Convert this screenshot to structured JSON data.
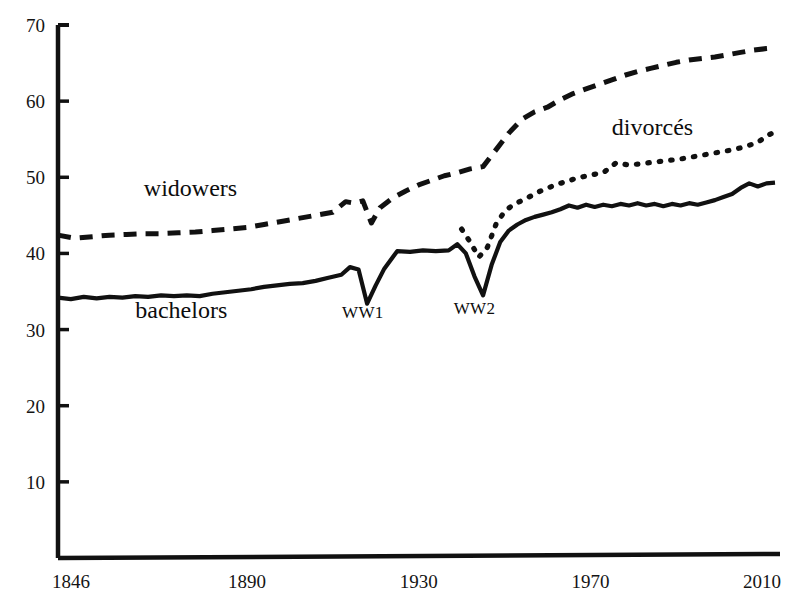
{
  "chart_data": {
    "type": "line",
    "title": "",
    "subtitle": "",
    "xlabel": "",
    "ylabel": "",
    "xlim": [
      1846,
      2013
    ],
    "ylim": [
      0,
      70
    ],
    "grid": false,
    "legend_position": "inline-annotations",
    "y_ticks": [
      10,
      20,
      30,
      40,
      50,
      60,
      70
    ],
    "y_tick_labels": [
      "10",
      "20",
      "30",
      "40",
      "50",
      "60",
      "70"
    ],
    "x_ticks": [
      1846,
      1890,
      1930,
      1970,
      2010
    ],
    "x_tick_labels": [
      "1846",
      "1890",
      "1930",
      "1970",
      "2010"
    ],
    "annotations": [
      {
        "text": "WW1",
        "x": 1917,
        "y": 31.5
      },
      {
        "text": "WW2",
        "x": 1943,
        "y": 32.0
      }
    ],
    "series": [
      {
        "name": "widowers",
        "label": "widowers",
        "style": "dashed",
        "label_x": 1866,
        "label_y": 47.5,
        "x": [
          1846,
          1850,
          1854,
          1858,
          1862,
          1866,
          1870,
          1874,
          1878,
          1882,
          1886,
          1890,
          1894,
          1898,
          1902,
          1906,
          1910,
          1913,
          1915,
          1917,
          1919,
          1921,
          1924,
          1927,
          1930,
          1933,
          1936,
          1939,
          1942,
          1945,
          1948,
          1951,
          1954,
          1957,
          1960,
          1963,
          1966,
          1969,
          1972,
          1975,
          1978,
          1981,
          1984,
          1987,
          1990,
          1993,
          1996,
          1999,
          2002,
          2005,
          2008,
          2011,
          2013
        ],
        "values": [
          42.4,
          42.0,
          42.2,
          42.4,
          42.5,
          42.6,
          42.6,
          42.7,
          42.8,
          43.0,
          43.2,
          43.4,
          43.8,
          44.2,
          44.6,
          45.0,
          45.4,
          46.8,
          46.6,
          46.9,
          44.0,
          46.0,
          47.3,
          48.2,
          49.0,
          49.6,
          50.2,
          50.6,
          51.1,
          51.4,
          53.6,
          55.8,
          57.6,
          58.6,
          59.2,
          60.2,
          61.0,
          61.6,
          62.2,
          62.8,
          63.4,
          63.9,
          64.3,
          64.7,
          65.1,
          65.4,
          65.6,
          65.8,
          66.1,
          66.4,
          66.7,
          66.9,
          67.0
        ]
      },
      {
        "name": "divorces",
        "label": "divorcés",
        "style": "dotted",
        "label_x": 1975,
        "label_y": 55.5,
        "x": [
          1940,
          1942,
          1944,
          1946,
          1948,
          1950,
          1952,
          1955,
          1958,
          1961,
          1964,
          1967,
          1970,
          1973,
          1976,
          1979,
          1982,
          1985,
          1988,
          1991,
          1994,
          1997,
          2000,
          2003,
          2006,
          2009,
          2011,
          2013
        ],
        "values": [
          43.2,
          41.5,
          39.5,
          40.8,
          43.8,
          45.5,
          46.4,
          47.2,
          48.1,
          48.8,
          49.4,
          49.9,
          50.3,
          50.6,
          51.9,
          51.6,
          51.8,
          52.0,
          52.2,
          52.4,
          52.7,
          53.0,
          53.3,
          53.6,
          54.0,
          54.6,
          55.4,
          56.0
        ]
      },
      {
        "name": "bachelors",
        "label": "bachelors",
        "style": "solid",
        "label_x": 1864,
        "label_y": 31.5,
        "x": [
          1846,
          1849,
          1852,
          1855,
          1858,
          1861,
          1864,
          1867,
          1870,
          1873,
          1876,
          1879,
          1882,
          1885,
          1888,
          1891,
          1894,
          1897,
          1900,
          1903,
          1906,
          1909,
          1912,
          1914,
          1916,
          1918,
          1920,
          1922,
          1925,
          1928,
          1931,
          1934,
          1937,
          1939,
          1941,
          1943,
          1945,
          1947,
          1949,
          1951,
          1953,
          1955,
          1957,
          1959,
          1961,
          1963,
          1965,
          1967,
          1969,
          1971,
          1973,
          1975,
          1977,
          1979,
          1981,
          1983,
          1985,
          1987,
          1989,
          1991,
          1993,
          1995,
          1997,
          1999,
          2001,
          2003,
          2005,
          2007,
          2009,
          2011,
          2013
        ],
        "values": [
          34.2,
          34.0,
          34.3,
          34.1,
          34.3,
          34.2,
          34.4,
          34.3,
          34.5,
          34.4,
          34.5,
          34.4,
          34.7,
          34.9,
          35.1,
          35.3,
          35.6,
          35.8,
          36.0,
          36.1,
          36.4,
          36.8,
          37.2,
          38.2,
          37.9,
          33.4,
          35.8,
          38.0,
          40.3,
          40.2,
          40.4,
          40.3,
          40.4,
          41.2,
          40.0,
          37.0,
          34.5,
          38.5,
          41.5,
          43.0,
          43.8,
          44.4,
          44.8,
          45.1,
          45.4,
          45.8,
          46.3,
          46.0,
          46.4,
          46.1,
          46.4,
          46.2,
          46.5,
          46.3,
          46.6,
          46.3,
          46.5,
          46.2,
          46.5,
          46.3,
          46.6,
          46.4,
          46.7,
          47.0,
          47.4,
          47.8,
          48.6,
          49.2,
          48.8,
          49.2,
          49.3
        ]
      }
    ]
  },
  "axis": {
    "axis_color": "#111111"
  }
}
